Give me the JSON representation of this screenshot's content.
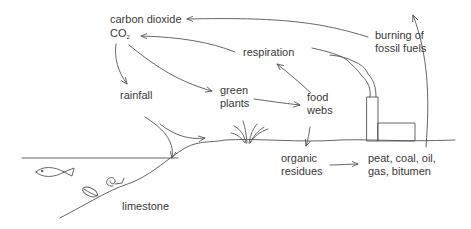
{
  "diagram": {
    "labels": {
      "carbon_dioxide": "carbon dioxide",
      "co2_main": "CO",
      "co2_sub": "2",
      "rainfall": "rainfall",
      "green_plants_1": "green",
      "green_plants_2": "plants",
      "respiration": "respiration",
      "food_webs_1": "food",
      "food_webs_2": "webs",
      "burning_1": "burning of",
      "burning_2": "fossil fuels",
      "organic_1": "organic",
      "organic_2": "residues",
      "fossil_1": "peat, coal, oil,",
      "fossil_2": "gas, bitumen",
      "limestone": "limestone"
    },
    "arrows": [
      {
        "from": "burning of fossil fuels",
        "to": "carbon dioxide"
      },
      {
        "from": "respiration",
        "to": "CO2"
      },
      {
        "from": "CO2",
        "to": "rainfall"
      },
      {
        "from": "CO2",
        "to": "green plants"
      },
      {
        "from": "green plants",
        "to": "food webs"
      },
      {
        "from": "food webs",
        "to": "respiration"
      },
      {
        "from": "food webs",
        "to": "ground / organic residues"
      },
      {
        "from": "rainfall",
        "to": "sea"
      },
      {
        "from": "rainfall",
        "to": "land"
      },
      {
        "from": "organic residues",
        "to": "peat, coal, oil, gas, bitumen"
      },
      {
        "from": "fossil fuels",
        "to": "burning of fossil fuels"
      }
    ],
    "icons": [
      "fish-icon",
      "snail-icon",
      "shell-icon",
      "grass-icon",
      "factory-icon",
      "smoke-icon"
    ],
    "colors": {
      "line": "#555555",
      "text": "#3a3a3a",
      "background": "#ffffff"
    }
  }
}
